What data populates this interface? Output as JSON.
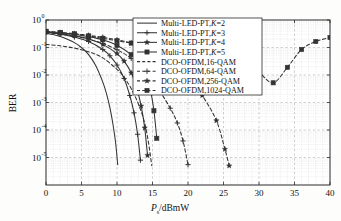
{
  "chart_data": {
    "type": "line",
    "title": "",
    "xlabel": "P_s/dBmW",
    "xlabel_main": "P",
    "xlabel_sub": "s",
    "xlabel_rest": "/dBmW",
    "ylabel": "BER",
    "xlim": [
      0,
      40
    ],
    "ylim": [
      1e-06,
      1
    ],
    "yscale": "log",
    "xticks": [
      0,
      5,
      10,
      15,
      20,
      25,
      30,
      35,
      40
    ],
    "xtick_labels": [
      "0",
      "5",
      "10",
      "15",
      "20",
      "25",
      "30",
      "35",
      "40"
    ],
    "yticks": [
      1,
      0.1,
      0.01,
      0.001,
      0.0001,
      1e-05
    ],
    "ytick_labels": [
      "10^0",
      "10^-1",
      "10^-2",
      "10^-3",
      "10^-4",
      "10^-5"
    ],
    "ytick_mantissa": [
      "10",
      "10",
      "10",
      "10",
      "10",
      "10"
    ],
    "ytick_exponents": [
      "0",
      "-1",
      "-2",
      "-3",
      "-4",
      "-5"
    ],
    "grid": true,
    "grid_minor": true,
    "legend_position": "upper center",
    "series": [
      {
        "name": "Multi-LED-PT,K=2",
        "label_main": "Multi-LED-PT,",
        "label_ital": "K",
        "label_tail": "=2",
        "style": "solid",
        "marker": "none",
        "color": "#333333",
        "x": [
          0,
          1,
          2,
          3,
          4,
          5,
          6,
          7,
          8,
          8.5,
          9,
          9.4,
          9.8,
          10.1
        ],
        "y": [
          0.33,
          0.295,
          0.25,
          0.2,
          0.15,
          0.1,
          0.055,
          0.022,
          0.0055,
          0.0022,
          0.00065,
          0.00018,
          3.5e-05,
          5.5e-06
        ]
      },
      {
        "name": "Multi-LED-PT,K=3",
        "label_main": "Multi-LED-PT,",
        "label_ital": "K",
        "label_tail": "=3",
        "style": "solid",
        "marker": "plus",
        "color": "#333333",
        "x": [
          0,
          2,
          4,
          6,
          8,
          9,
          10,
          11,
          11.8,
          12.4,
          12.9,
          13.3
        ],
        "y": [
          0.36,
          0.305,
          0.24,
          0.165,
          0.085,
          0.05,
          0.023,
          0.0075,
          0.0018,
          0.00042,
          7e-05,
          8e-06
        ]
      },
      {
        "name": "Multi-LED-PT,K=4",
        "label_main": "Multi-LED-PT,",
        "label_ital": "K",
        "label_tail": "=4",
        "style": "solid",
        "marker": "star",
        "color": "#333333",
        "x": [
          0,
          2,
          4,
          6,
          8,
          10,
          11,
          12,
          12.8,
          13.4,
          13.9,
          14.3
        ],
        "y": [
          0.37,
          0.325,
          0.27,
          0.205,
          0.13,
          0.06,
          0.032,
          0.012,
          0.0032,
          0.00075,
          0.00012,
          1.2e-05
        ]
      },
      {
        "name": "Multi-LED-PT,K=5",
        "label_main": "Multi-LED-PT,",
        "label_ital": "K",
        "label_tail": "=5",
        "style": "solid",
        "marker": "square",
        "color": "#333333",
        "x": [
          0,
          2,
          4,
          6,
          8,
          10,
          12,
          13,
          14,
          14.7,
          15.2,
          15.6
        ],
        "y": [
          0.38,
          0.345,
          0.3,
          0.25,
          0.19,
          0.12,
          0.055,
          0.03,
          0.0105,
          0.0028,
          0.0005,
          5e-05
        ]
      },
      {
        "name": "DCO-OFDM,16-QAM",
        "label_main": "DCO-OFDM,16-QAM",
        "label_ital": "",
        "label_tail": "",
        "style": "dashed",
        "marker": "none",
        "color": "#333333",
        "x": [
          0,
          2,
          4,
          6,
          8,
          10,
          11,
          12,
          13,
          13.8,
          14.4,
          14.9
        ],
        "y": [
          0.13,
          0.115,
          0.095,
          0.07,
          0.042,
          0.016,
          0.0082,
          0.0032,
          0.0009,
          0.00022,
          4e-05,
          5e-06
        ]
      },
      {
        "name": "DCO-OFDM,64-QAM",
        "label_main": "DCO-OFDM,64-QAM",
        "label_ital": "",
        "label_tail": "",
        "style": "dashed",
        "marker": "plus",
        "color": "#333333",
        "x": [
          0,
          2,
          4,
          6,
          8,
          10,
          12,
          14,
          16,
          17.5,
          18.5,
          19.3,
          20
        ],
        "y": [
          0.35,
          0.31,
          0.26,
          0.2,
          0.14,
          0.083,
          0.04,
          0.013,
          0.0026,
          0.00062,
          0.00018,
          4e-05,
          5.5e-06
        ]
      },
      {
        "name": "DCO-OFDM,256-QAM",
        "label_main": "DCO-OFDM,256-QAM",
        "label_ital": "",
        "label_tail": "",
        "style": "dashed",
        "marker": "star",
        "color": "#333333",
        "x": [
          0,
          2,
          4,
          6,
          8,
          10,
          12,
          14,
          16,
          18,
          20,
          22,
          24,
          25.2,
          25.8
        ],
        "y": [
          0.37,
          0.345,
          0.315,
          0.275,
          0.235,
          0.19,
          0.145,
          0.1,
          0.057,
          0.026,
          0.0082,
          0.0018,
          0.00022,
          2e-05,
          5e-06
        ]
      },
      {
        "name": "DCO-OFDM,1024-QAM",
        "label_main": "DCO-OFDM,1024-QAM",
        "label_ital": "",
        "label_tail": "",
        "style": "dashed",
        "marker": "square",
        "color": "#333333",
        "x": [
          0,
          2,
          4,
          6,
          8,
          10,
          12,
          14,
          16,
          20,
          24,
          26,
          28,
          30,
          32,
          34,
          36,
          38,
          40
        ],
        "y": [
          0.39,
          0.355,
          0.315,
          0.265,
          0.215,
          0.175,
          0.145,
          0.125,
          0.115,
          0.105,
          0.09,
          0.07,
          0.042,
          0.013,
          0.0052,
          0.019,
          0.085,
          0.165,
          0.23
        ],
        "note": "valley-shaped curve with minimum near 30 dBmW"
      }
    ]
  },
  "legend": {
    "entries": [
      "Multi-LED-PT,K=2",
      "Multi-LED-PT,K=3",
      "Multi-LED-PT,K=4",
      "Multi-LED-PT,K=5",
      "DCO-OFDM,16-QAM",
      "DCO-OFDM,64-QAM",
      "DCO-OFDM,256-QAM",
      "DCO-OFDM,1024-QAM"
    ]
  }
}
